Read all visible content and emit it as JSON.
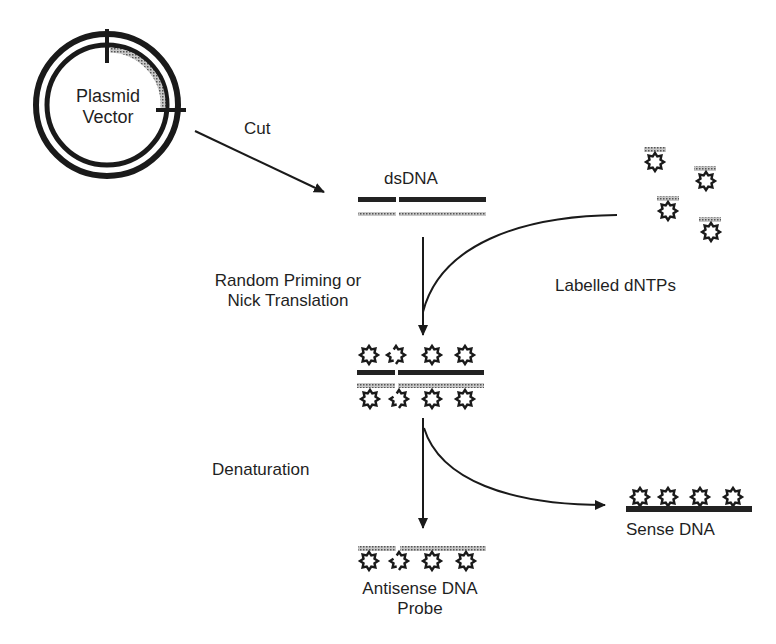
{
  "diagram": {
    "title": "",
    "nodes": {
      "plasmid": {
        "line1": "Plasmid",
        "line2": "Vector"
      },
      "dsdna": {
        "label": "dsDNA"
      },
      "dntps": {
        "label": "Labelled dNTPs"
      },
      "labelled_duplex": {
        "label": ""
      },
      "antisense": {
        "line1": "Antisense DNA",
        "line2": "Probe"
      },
      "sense": {
        "label": "Sense DNA"
      }
    },
    "steps": {
      "cut": "Cut",
      "priming_line1": "Random Priming or",
      "priming_line2": "Nick Translation",
      "denaturation": "Denaturation"
    },
    "edges": [
      {
        "from": "plasmid",
        "to": "dsdna",
        "label": "Cut"
      },
      {
        "from": "dsdna",
        "to": "labelled_duplex",
        "label": "Random Priming or Nick Translation"
      },
      {
        "from": "dntps",
        "to": "labelled_duplex",
        "label": ""
      },
      {
        "from": "labelled_duplex",
        "to": "antisense",
        "label": "Denaturation"
      },
      {
        "from": "labelled_duplex",
        "to": "sense",
        "label": ""
      }
    ],
    "colors": {
      "ink": "#1a1a1a",
      "stippled_strand": "#8a8a8a",
      "background": "#ffffff"
    }
  }
}
